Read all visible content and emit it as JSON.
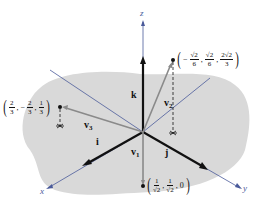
{
  "diagram": {
    "type": "3d-vector-diagram",
    "axes": [
      {
        "name": "x",
        "label": "x"
      },
      {
        "name": "y",
        "label": "y"
      },
      {
        "name": "z",
        "label": "z"
      }
    ],
    "unit_vectors": [
      {
        "name": "i",
        "label": "i"
      },
      {
        "name": "j",
        "label": "j"
      },
      {
        "name": "k",
        "label": "k"
      }
    ],
    "vectors": [
      {
        "name": "v1",
        "label": "v",
        "sub": "1"
      },
      {
        "name": "v2",
        "label": "v",
        "sub": "2"
      },
      {
        "name": "v3",
        "label": "v",
        "sub": "3"
      }
    ],
    "points": {
      "p1": {
        "open": "(",
        "c1_num": "1",
        "c1_den": "√2",
        "sep1": ",",
        "c2_sign": "",
        "c2_num": "1",
        "c2_den": "√2",
        "sep2": ",",
        "c3": "0",
        "close": ")"
      },
      "p2": {
        "open": "(",
        "c1_sign": "−",
        "c1_num": "√2",
        "c1_den": "6",
        "sep1": ",",
        "c2_num": "√2",
        "c2_den": "6",
        "sep2": ",",
        "c3_num": "2√2",
        "c3_den": "3",
        "close": ")"
      },
      "p3": {
        "open": "(",
        "c1_num": "2",
        "c1_den": "3",
        "sep1": ",",
        "c2_sign": "−",
        "c2_num": "2",
        "c2_den": "3",
        "sep2": ",",
        "c3_num": "1",
        "c3_den": "3",
        "close": ")"
      }
    },
    "colors": {
      "plane": "#d9d9d9",
      "axis": "#4a5a9a",
      "unit_vector": "#111111",
      "v_vector": "#8a8a8a"
    }
  }
}
